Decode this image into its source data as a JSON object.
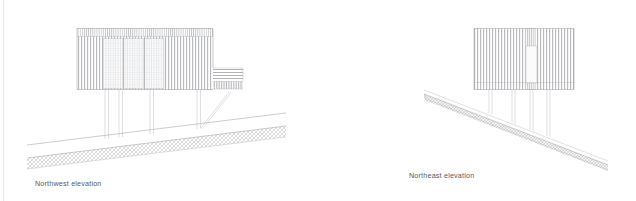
{
  "document": {
    "type": "architectural-elevation-drawing",
    "sheet_background": "#ffffff",
    "line_color": "#8f9094",
    "caption_color": "#59595b"
  },
  "figures": [
    {
      "id": "northwest-elevation",
      "caption": "Northwest elevation",
      "building": {
        "facade_cladding": "vertical timber battens",
        "glazing_panels": 5,
        "columns": 5,
        "has_diagonal_brace": true,
        "deck": {
          "present": true,
          "hatch_left": "cross-hatch grid",
          "hatch_right": "horizontal lines"
        }
      },
      "ground": {
        "slope": "rising to the right",
        "hatch": "diagonal cross-hatch"
      }
    },
    {
      "id": "northeast-elevation",
      "caption": "Northeast elevation",
      "building": {
        "facade_cladding": "vertical timber battens",
        "window": {
          "count": 1,
          "shape": "tall narrow rectangle"
        },
        "columns": 5
      },
      "ground": {
        "slope": "falling to the left",
        "hatch": "diagonal cross-hatch"
      }
    }
  ],
  "captions": {
    "northwest": "Northwest elevation",
    "northeast": "Northeast elevation"
  }
}
